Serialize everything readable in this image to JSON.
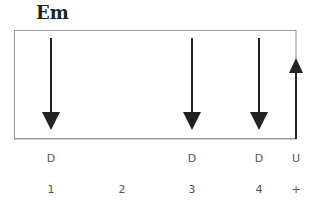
{
  "chord": {
    "name": "Em"
  },
  "strum_pattern": [
    {
      "beat": "1",
      "stroke": "D",
      "direction": "down",
      "x": 51
    },
    {
      "beat": "2",
      "stroke": "",
      "direction": "none",
      "x": 122
    },
    {
      "beat": "3",
      "stroke": "D",
      "direction": "down",
      "x": 192
    },
    {
      "beat": "4",
      "stroke": "D",
      "direction": "down",
      "x": 259
    },
    {
      "beat": "+",
      "stroke": "U",
      "direction": "up",
      "x": 296
    }
  ],
  "colors": {
    "arrow": "#222222",
    "box_border": "#999999",
    "label": "#555555"
  }
}
